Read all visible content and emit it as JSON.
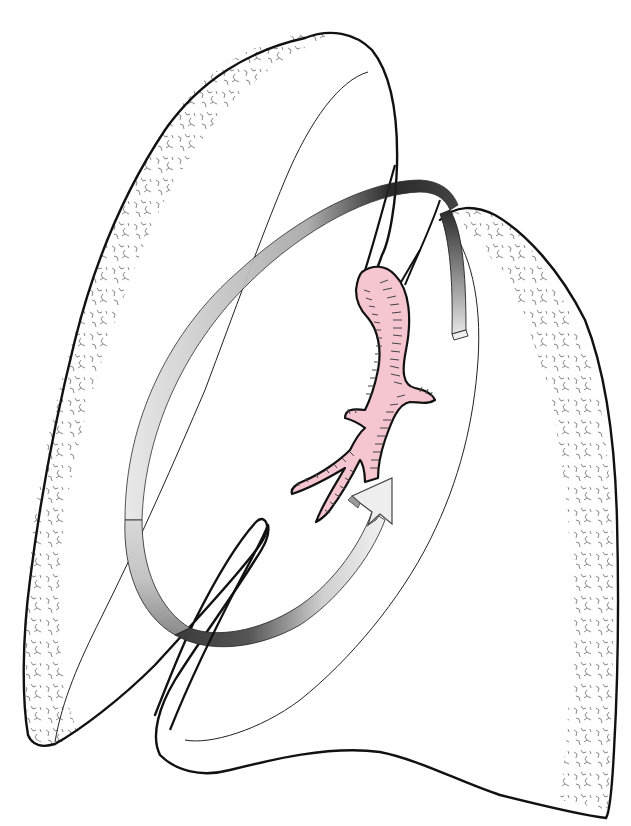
{
  "figure": {
    "title": "Lungs with bronchus and circular arrow",
    "colors": {
      "background": "#ffffff",
      "outline": "#111111",
      "bronchus_fill": "#f5c6cf",
      "bronchus_ticks": "#333333",
      "arrow_light": "#f4f4f4",
      "arrow_mid": "#bdbdbd",
      "arrow_dark": "#2e2e2e",
      "texture": "#444444"
    },
    "elements": {
      "left_lung": "left-lung",
      "right_lung": "right-lung",
      "bronchus": "main-bronchus",
      "arrow": "rotation-arrow"
    }
  }
}
